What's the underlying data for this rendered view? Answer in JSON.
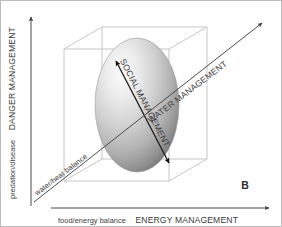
{
  "figure": {
    "panel_label": "B",
    "background_color": "#ffffff",
    "border_color": "#bdbdbd"
  },
  "axes": {
    "vertical": {
      "qualifier": "predation/disease",
      "title": "DANGER MANAGEMENT",
      "arrow_direction": "up",
      "color": "#4a4a4a"
    },
    "horizontal": {
      "qualifier": "food/energy balance",
      "title": "ENERGY MANAGEMENT",
      "arrow_direction": "right",
      "color": "#4a4a4a"
    },
    "depth": {
      "qualifier": "water/heat balance",
      "title": "WATER MANAGEMENT",
      "arrow_direction": "upper-right",
      "color": "#4a4a4a"
    }
  },
  "volume": {
    "shape_name": "ellipsoid",
    "bounding_box_name": "3d-wireframe-box",
    "box_color": "#c6c6c6",
    "fill_light": "#f2f2f2",
    "fill_mid": "#b5b5b5",
    "fill_dark": "#6f6f6f"
  },
  "internal_axis": {
    "title": "SOCIAL MANAGEMENT",
    "arrow_direction": "double",
    "color": "#1a1a1a"
  },
  "icons": {
    "arrow_up": "arrow-up-icon",
    "arrow_right": "arrow-right-icon",
    "arrow_diagonal": "arrow-diagonal-icon",
    "arrow_double": "arrow-double-icon"
  }
}
